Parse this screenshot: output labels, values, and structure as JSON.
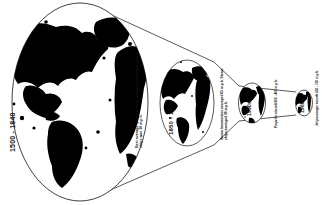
{
  "figure": {
    "type": "time-space convergence diagram",
    "background_color": "#ffffff",
    "ink_color": "#000000"
  },
  "panels": [
    {
      "id": "panel-1",
      "date_label": "1500 - 1840",
      "caption": "Best average speed of horse drawn coaches and sailing ships was 10 m.p.h.",
      "globe_size": "largest",
      "speed_value": "10",
      "speed_unit": "m.p.h."
    },
    {
      "id": "panel-2",
      "date_label": "1850 - 1930",
      "caption": "Steam locomotives averaged 65 m.p.h. Steam ships averaged 36 m.p.h.",
      "globe_size": "large",
      "speed_value": "65",
      "speed_unit": "m.p.h."
    },
    {
      "id": "panel-3",
      "date_label": "1950s",
      "caption": "Propeller aircraft 300 - 400 m.p.h.",
      "globe_size": "small",
      "speed_value": "300 - 400",
      "speed_unit": "m.p.h."
    },
    {
      "id": "panel-4",
      "date_label": "1960s",
      "caption": "Jet passenger aircraft 500 - 700 m.p.h.",
      "globe_size": "smallest",
      "speed_value": "500 - 700",
      "speed_unit": "m.p.h."
    }
  ]
}
